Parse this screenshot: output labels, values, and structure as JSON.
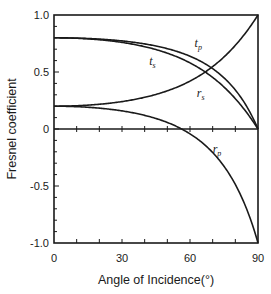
{
  "chart_data": {
    "type": "line",
    "title": "",
    "xlabel": "Angle of Incidence(°)",
    "ylabel": "Fresnel coefficient",
    "xlim": [
      0,
      90
    ],
    "ylim": [
      -1.0,
      1.0
    ],
    "grid": false,
    "legend": "inline curve labels",
    "x_ticks": [
      0,
      30,
      60,
      90
    ],
    "x_tick_labels": [
      "0",
      "30",
      "60",
      "90"
    ],
    "y_ticks": [
      1.0,
      0.5,
      0,
      -0.5,
      -1.0
    ],
    "y_tick_labels": [
      "1.0",
      "0.5",
      "0",
      "-0.5",
      "-1.0"
    ],
    "x": [
      0,
      10,
      20,
      30,
      40,
      50,
      56.3,
      60,
      70,
      80,
      85,
      88,
      90
    ],
    "series": [
      {
        "name": "t_p",
        "label": "t",
        "subscript": "p",
        "values": [
          0.8,
          0.797,
          0.789,
          0.773,
          0.746,
          0.705,
          0.667,
          0.638,
          0.529,
          0.342,
          0.198,
          0.085,
          0.0
        ]
      },
      {
        "name": "t_s",
        "label": "t",
        "subscript": "s",
        "values": [
          0.8,
          0.796,
          0.783,
          0.76,
          0.722,
          0.665,
          0.617,
          0.58,
          0.453,
          0.266,
          0.144,
          0.06,
          0.0
        ]
      },
      {
        "name": "r_s",
        "label": "r",
        "subscript": "s",
        "values": [
          0.2,
          0.204,
          0.217,
          0.24,
          0.278,
          0.335,
          0.383,
          0.42,
          0.547,
          0.734,
          0.856,
          0.94,
          1.0
        ]
      },
      {
        "name": "r_p",
        "label": "r",
        "subscript": "p",
        "values": [
          0.2,
          0.196,
          0.183,
          0.159,
          0.12,
          0.057,
          0.0,
          -0.042,
          -0.206,
          -0.487,
          -0.702,
          -0.87,
          -1.0
        ]
      }
    ],
    "annotations": [
      {
        "text": "t_p",
        "x": 62,
        "y": 0.72
      },
      {
        "text": "t_s",
        "x": 42,
        "y": 0.56
      },
      {
        "text": "r_s",
        "x": 63,
        "y": 0.28
      },
      {
        "text": "r_p",
        "x": 70,
        "y": -0.21
      }
    ],
    "minor_x_ticks_step": 10,
    "minor_y_ticks_step": 0.1
  },
  "style": {
    "line_color": "#1a1a1a",
    "background": "#ffffff"
  }
}
